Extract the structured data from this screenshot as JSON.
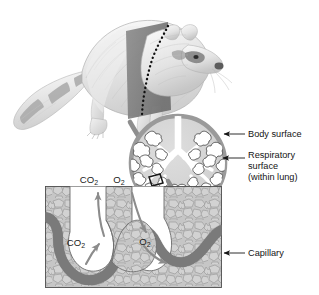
{
  "figure": {
    "organism": "raccoon",
    "colors": {
      "body_surface_ring": "#9a9a9a",
      "lung_interior": "#d4d4d4",
      "capillary": "#7d7d7d",
      "tissue": "#c9c9c9",
      "arrow_gray": "#8e8e8e",
      "text": "#141414",
      "background": "#ffffff",
      "cut_plane": "#808080"
    }
  },
  "labels": [
    {
      "id": "body-surface",
      "text": "Body surface",
      "lines": [
        "Body surface"
      ]
    },
    {
      "id": "respiratory-surface",
      "text": "Respiratory surface (within lung)",
      "lines": [
        "Respiratory",
        "surface",
        "(within lung)"
      ]
    },
    {
      "id": "capillary",
      "text": "Capillary",
      "lines": [
        "Capillary"
      ]
    }
  ],
  "gas_labels": {
    "co2_top": {
      "symbol": "CO",
      "subscript": "2"
    },
    "o2_top": {
      "symbol": "O",
      "subscript": "2"
    },
    "co2_inner": {
      "symbol": "CO",
      "subscript": "2"
    },
    "o2_inner": {
      "symbol": "O",
      "subscript": "2"
    }
  },
  "panels": {
    "animal": {
      "name": "raccoon-illustration"
    },
    "lung_circle": {
      "name": "lung-cross-section"
    },
    "tissue_box": {
      "name": "alveolus-capillary-detail"
    }
  }
}
